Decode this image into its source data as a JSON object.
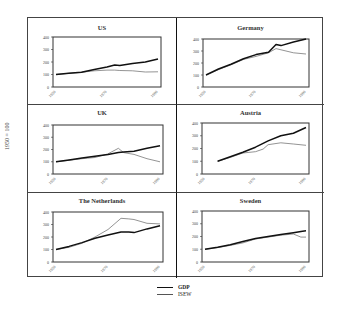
{
  "y_axis_title": "1950 = 100",
  "legend": [
    {
      "name": "GDP",
      "style": "thick-dark"
    },
    {
      "name": "ISEW",
      "style": "thin-grey"
    }
  ],
  "colors": {
    "gdp": "#111111",
    "isew": "#666666",
    "frame": "#444444"
  },
  "chart_data": [
    {
      "type": "line",
      "title": "US",
      "ylim": [
        0,
        400
      ],
      "yticks": [
        0,
        100,
        200,
        300,
        400
      ],
      "xticks": [
        "1950",
        "1970",
        "1990"
      ],
      "xlabel": "",
      "ylabel": "1950 = 100",
      "x": [
        1950,
        1955,
        1960,
        1965,
        1970,
        1973,
        1975,
        1980,
        1985,
        1990
      ],
      "series": [
        {
          "name": "GDP",
          "values": [
            100,
            110,
            118,
            140,
            160,
            175,
            172,
            188,
            200,
            225
          ]
        },
        {
          "name": "ISEW",
          "values": [
            100,
            110,
            118,
            130,
            135,
            135,
            132,
            130,
            120,
            122
          ]
        }
      ]
    },
    {
      "type": "line",
      "title": "Germany",
      "ylim": [
        0,
        400
      ],
      "yticks": [
        0,
        100,
        200,
        300,
        400
      ],
      "xticks": [
        "1950",
        "1970",
        "1990"
      ],
      "xlabel": "",
      "ylabel": "1950 = 100",
      "x": [
        1950,
        1955,
        1960,
        1965,
        1970,
        1975,
        1978,
        1980,
        1985,
        1990
      ],
      "series": [
        {
          "name": "GDP",
          "values": [
            100,
            150,
            190,
            235,
            270,
            290,
            355,
            345,
            375,
            400
          ]
        },
        {
          "name": "ISEW",
          "values": [
            100,
            145,
            185,
            230,
            255,
            285,
            320,
            310,
            285,
            275
          ]
        }
      ]
    },
    {
      "type": "line",
      "title": "UK",
      "ylim": [
        0,
        400
      ],
      "yticks": [
        0,
        100,
        200,
        300,
        400
      ],
      "xticks": [
        "1950",
        "1970",
        "1990"
      ],
      "xlabel": "",
      "ylabel": "1950 = 100",
      "x": [
        1950,
        1955,
        1960,
        1965,
        1970,
        1974,
        1976,
        1980,
        1985,
        1990
      ],
      "series": [
        {
          "name": "GDP",
          "values": [
            100,
            115,
            130,
            145,
            160,
            175,
            180,
            185,
            210,
            230
          ]
        },
        {
          "name": "ISEW",
          "values": [
            100,
            112,
            125,
            135,
            165,
            210,
            175,
            160,
            125,
            100
          ]
        }
      ]
    },
    {
      "type": "line",
      "title": "Austria",
      "ylim": [
        0,
        400
      ],
      "yticks": [
        0,
        100,
        200,
        300,
        400
      ],
      "xticks": [
        "1950",
        "1970",
        "1990"
      ],
      "xlabel": "",
      "ylabel": "1950 = 100",
      "x": [
        1955,
        1960,
        1965,
        1970,
        1973,
        1975,
        1980,
        1985,
        1990
      ],
      "series": [
        {
          "name": "GDP",
          "values": [
            100,
            135,
            170,
            210,
            240,
            260,
            300,
            320,
            365
          ]
        },
        {
          "name": "ISEW",
          "values": [
            100,
            130,
            165,
            175,
            195,
            230,
            245,
            235,
            225
          ]
        }
      ]
    },
    {
      "type": "line",
      "title": "The Netherlands",
      "ylim": [
        0,
        400
      ],
      "yticks": [
        0,
        100,
        200,
        300,
        400
      ],
      "xticks": [
        "1950",
        "1970",
        "1990"
      ],
      "xlabel": "",
      "ylabel": "1950 = 100",
      "x": [
        1950,
        1955,
        1960,
        1965,
        1970,
        1975,
        1978,
        1980,
        1985,
        1990
      ],
      "series": [
        {
          "name": "GDP",
          "values": [
            100,
            125,
            155,
            190,
            215,
            240,
            240,
            235,
            265,
            290
          ]
        },
        {
          "name": "ISEW",
          "values": [
            100,
            118,
            150,
            200,
            260,
            350,
            345,
            340,
            310,
            305
          ]
        }
      ]
    },
    {
      "type": "line",
      "title": "Sweden",
      "ylim": [
        0,
        400
      ],
      "yticks": [
        0,
        100,
        200,
        300,
        400
      ],
      "xticks": [
        "1950",
        "1970",
        "1990"
      ],
      "xlabel": "",
      "ylabel": "1950 = 100",
      "x": [
        1950,
        1955,
        1960,
        1965,
        1970,
        1975,
        1980,
        1985,
        1988,
        1990
      ],
      "series": [
        {
          "name": "GDP",
          "values": [
            100,
            115,
            135,
            160,
            185,
            200,
            215,
            230,
            240,
            245
          ]
        },
        {
          "name": "ISEW",
          "values": [
            100,
            113,
            130,
            150,
            180,
            195,
            210,
            220,
            195,
            195
          ]
        }
      ]
    }
  ]
}
